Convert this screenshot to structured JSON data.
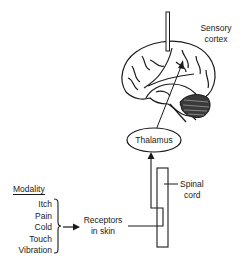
{
  "labels": {
    "sensory_cortex": [
      "Sensory",
      "cortex"
    ],
    "thalamus": "Thalamus",
    "spinal_cord": [
      "Spinal",
      "cord"
    ],
    "receptors": [
      "Receptors",
      "in skin"
    ],
    "modality_title": "Modality"
  },
  "modalities": [
    "Itch",
    "Pain",
    "Cold",
    "Touch",
    "Vibration"
  ],
  "colors": {
    "ink": "#1a1a1a",
    "background": "#ffffff"
  }
}
